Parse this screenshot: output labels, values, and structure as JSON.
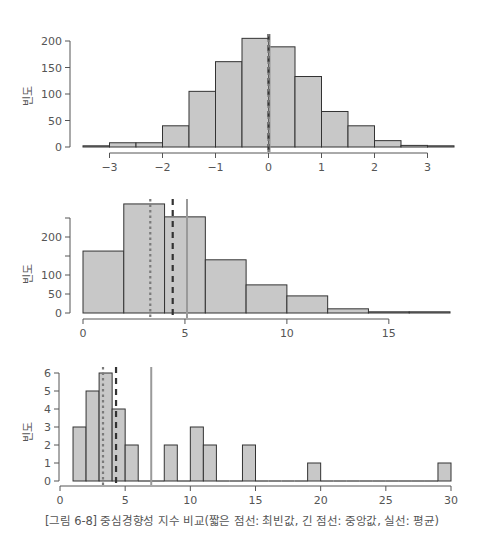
{
  "caption": "[그림 6-8] 중심경향성 지수 비교(짧은 점선: 최빈값, 긴 점선: 중앙값, 실선: 평균)",
  "colors": {
    "bar_fill": "#c8c8c8",
    "bar_stroke": "#333333",
    "axis": "#555555",
    "mode_line": "#7a7a7a",
    "median_line": "#333333",
    "mean_line": "#9a9a9a"
  },
  "chart_data": [
    {
      "type": "bar",
      "title": "",
      "xlabel": "",
      "ylabel": "빈도",
      "bin_width": 0.5,
      "bins": [
        {
          "start": -3.5,
          "end": -3.0,
          "value": 1
        },
        {
          "start": -3.0,
          "end": -2.5,
          "value": 8
        },
        {
          "start": -2.5,
          "end": -2.0,
          "value": 8
        },
        {
          "start": -2.0,
          "end": -1.5,
          "value": 40
        },
        {
          "start": -1.5,
          "end": -1.0,
          "value": 105
        },
        {
          "start": -1.0,
          "end": -0.5,
          "value": 161
        },
        {
          "start": -0.5,
          "end": 0.0,
          "value": 205
        },
        {
          "start": 0.0,
          "end": 0.5,
          "value": 189
        },
        {
          "start": 0.5,
          "end": 1.0,
          "value": 133
        },
        {
          "start": 1.0,
          "end": 1.5,
          "value": 67
        },
        {
          "start": 1.5,
          "end": 2.0,
          "value": 40
        },
        {
          "start": 2.0,
          "end": 2.5,
          "value": 12
        },
        {
          "start": 2.5,
          "end": 3.0,
          "value": 3
        },
        {
          "start": 3.0,
          "end": 3.5,
          "value": 1
        }
      ],
      "xlim": [
        -3.5,
        3.5
      ],
      "ylim": [
        0,
        210
      ],
      "xticks": [
        -3,
        -2,
        -1,
        0,
        1,
        2,
        3
      ],
      "xtick_labels": [
        "−3",
        "−2",
        "−1",
        "0",
        "1",
        "2",
        "3"
      ],
      "yticks": [
        0,
        50,
        100,
        150,
        200
      ],
      "ytick_labels": [
        "0",
        "50",
        "100",
        "150",
        "200"
      ],
      "mode": 0.0,
      "median": 0.0,
      "mean": 0.02,
      "grid": false
    },
    {
      "type": "bar",
      "title": "",
      "xlabel": "",
      "ylabel": "빈도",
      "bin_width": 2,
      "bins": [
        {
          "start": 0,
          "end": 2,
          "value": 163
        },
        {
          "start": 2,
          "end": 4,
          "value": 287
        },
        {
          "start": 4,
          "end": 6,
          "value": 253
        },
        {
          "start": 6,
          "end": 8,
          "value": 140
        },
        {
          "start": 8,
          "end": 10,
          "value": 74
        },
        {
          "start": 10,
          "end": 12,
          "value": 45
        },
        {
          "start": 12,
          "end": 14,
          "value": 11
        },
        {
          "start": 14,
          "end": 16,
          "value": 1
        },
        {
          "start": 16,
          "end": 18,
          "value": 1
        }
      ],
      "xlim": [
        0,
        18
      ],
      "ylim": [
        0,
        300
      ],
      "xticks": [
        0,
        5,
        10,
        15
      ],
      "xtick_labels": [
        "0",
        "5",
        "10",
        "15"
      ],
      "yticks": [
        0,
        50,
        100,
        150,
        200,
        250
      ],
      "ytick_labels": [
        "0",
        "50",
        "100",
        "",
        "200",
        ""
      ],
      "mode": 3.3,
      "median": 4.4,
      "mean": 5.1,
      "grid": false
    },
    {
      "type": "bar",
      "title": "",
      "xlabel": "",
      "ylabel": "빈도",
      "bin_width": 1,
      "bins": [
        {
          "start": 1,
          "end": 2,
          "value": 3
        },
        {
          "start": 2,
          "end": 3,
          "value": 5
        },
        {
          "start": 3,
          "end": 4,
          "value": 6
        },
        {
          "start": 4,
          "end": 5,
          "value": 4
        },
        {
          "start": 5,
          "end": 6,
          "value": 2
        },
        {
          "start": 6,
          "end": 7,
          "value": 0
        },
        {
          "start": 7,
          "end": 8,
          "value": 0
        },
        {
          "start": 8,
          "end": 9,
          "value": 2
        },
        {
          "start": 9,
          "end": 10,
          "value": 0
        },
        {
          "start": 10,
          "end": 11,
          "value": 3
        },
        {
          "start": 11,
          "end": 12,
          "value": 2
        },
        {
          "start": 12,
          "end": 13,
          "value": 0
        },
        {
          "start": 13,
          "end": 14,
          "value": 0
        },
        {
          "start": 14,
          "end": 15,
          "value": 2
        },
        {
          "start": 15,
          "end": 16,
          "value": 0
        },
        {
          "start": 16,
          "end": 17,
          "value": 0
        },
        {
          "start": 17,
          "end": 18,
          "value": 0
        },
        {
          "start": 18,
          "end": 19,
          "value": 0
        },
        {
          "start": 19,
          "end": 20,
          "value": 1
        },
        {
          "start": 20,
          "end": 21,
          "value": 0
        },
        {
          "start": 21,
          "end": 22,
          "value": 0
        },
        {
          "start": 22,
          "end": 23,
          "value": 0
        },
        {
          "start": 23,
          "end": 24,
          "value": 0
        },
        {
          "start": 24,
          "end": 25,
          "value": 0
        },
        {
          "start": 25,
          "end": 26,
          "value": 0
        },
        {
          "start": 26,
          "end": 27,
          "value": 0
        },
        {
          "start": 27,
          "end": 28,
          "value": 0
        },
        {
          "start": 28,
          "end": 29,
          "value": 0
        },
        {
          "start": 29,
          "end": 30,
          "value": 1
        }
      ],
      "xlim": [
        0,
        30
      ],
      "ylim": [
        0,
        6.3
      ],
      "xticks": [
        0,
        5,
        10,
        15,
        20,
        25,
        30
      ],
      "xtick_labels": [
        "0",
        "5",
        "10",
        "15",
        "20",
        "25",
        "30"
      ],
      "yticks": [
        0,
        1,
        2,
        3,
        4,
        5,
        6
      ],
      "ytick_labels": [
        "0",
        "1",
        "2",
        "3",
        "4",
        "5",
        "6"
      ],
      "mode": 3.3,
      "median": 4.3,
      "mean": 7.0,
      "grid": false
    }
  ]
}
